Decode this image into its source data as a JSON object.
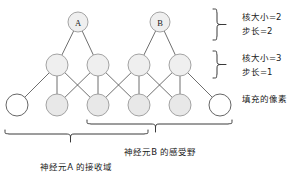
{
  "figure": {
    "type": "neural-network-receptive-field-diagram",
    "background_color": "#ffffff",
    "line_color": "#4a4a4a",
    "node_fill_gray": "#e8e8e8",
    "node_fill_white": "#ffffff",
    "node_stroke": "#8a8a8a"
  },
  "layers": {
    "top": {
      "nodes": [
        {
          "id": "A",
          "label": "A",
          "cx": 78,
          "cy": 22,
          "r": 10,
          "fill": "gray"
        },
        {
          "id": "B",
          "label": "B",
          "cx": 160,
          "cy": 22,
          "r": 10,
          "fill": "gray"
        }
      ]
    },
    "middle": {
      "nodes": [
        {
          "id": "m1",
          "label": "",
          "cx": 57,
          "cy": 65,
          "r": 11,
          "fill": "gray"
        },
        {
          "id": "m2",
          "label": "",
          "cx": 98,
          "cy": 65,
          "r": 11,
          "fill": "gray"
        },
        {
          "id": "m3",
          "label": "",
          "cx": 139,
          "cy": 65,
          "r": 11,
          "fill": "gray"
        },
        {
          "id": "m4",
          "label": "",
          "cx": 180,
          "cy": 65,
          "r": 11,
          "fill": "gray"
        }
      ]
    },
    "bottom": {
      "nodes": [
        {
          "id": "b0",
          "label": "",
          "cx": 17,
          "cy": 105,
          "r": 11,
          "fill": "white"
        },
        {
          "id": "b1",
          "label": "",
          "cx": 57,
          "cy": 105,
          "r": 11,
          "fill": "gray"
        },
        {
          "id": "b2",
          "label": "",
          "cx": 98,
          "cy": 105,
          "r": 11,
          "fill": "gray"
        },
        {
          "id": "b3",
          "label": "",
          "cx": 139,
          "cy": 105,
          "r": 11,
          "fill": "gray"
        },
        {
          "id": "b4",
          "label": "",
          "cx": 180,
          "cy": 105,
          "r": 11,
          "fill": "gray"
        },
        {
          "id": "b5",
          "label": "",
          "cx": 220,
          "cy": 105,
          "r": 11,
          "fill": "white"
        }
      ]
    }
  },
  "edges": {
    "top_to_middle": [
      {
        "from": "A",
        "to": "m1"
      },
      {
        "from": "A",
        "to": "m2"
      },
      {
        "from": "B",
        "to": "m3"
      },
      {
        "from": "B",
        "to": "m4"
      }
    ],
    "middle_to_bottom": [
      {
        "from": "m1",
        "to": "b0"
      },
      {
        "from": "m1",
        "to": "b1"
      },
      {
        "from": "m1",
        "to": "b2"
      },
      {
        "from": "m2",
        "to": "b1"
      },
      {
        "from": "m2",
        "to": "b2"
      },
      {
        "from": "m2",
        "to": "b3"
      },
      {
        "from": "m3",
        "to": "b2"
      },
      {
        "from": "m3",
        "to": "b3"
      },
      {
        "from": "m3",
        "to": "b4"
      },
      {
        "from": "m4",
        "to": "b3"
      },
      {
        "from": "m4",
        "to": "b4"
      },
      {
        "from": "m4",
        "to": "b5"
      }
    ]
  },
  "annotations": {
    "upper_layer": {
      "kernel_size": "核大小=2",
      "stride": "步长=2"
    },
    "lower_layer": {
      "kernel_size": "核大小=3",
      "stride": "步长=1"
    },
    "padding_label": "填充的像素",
    "receptive_field_a": "神经元A 的接收域",
    "receptive_field_b": "神经元B 的感受野"
  }
}
